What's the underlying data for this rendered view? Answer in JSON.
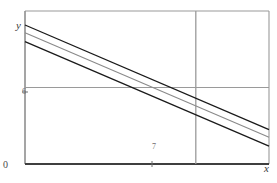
{
  "figure": {
    "axis_labels": {
      "x": "x",
      "y": "y"
    },
    "origin_label": "0",
    "tick_labels": {
      "x": "7",
      "y": "6"
    }
  },
  "chart_data": {
    "type": "line",
    "title": "",
    "xlabel": "x",
    "ylabel": "y",
    "xlim": [
      0,
      10
    ],
    "ylim": [
      0,
      12
    ],
    "grid": true,
    "gridlines": {
      "vertical": [
        7
      ],
      "horizontal": [
        6
      ]
    },
    "legend": "none",
    "annotations": [
      "Three parallel lines with equal negative slope",
      "Middle line passes through the point (7, 6)"
    ],
    "series": [
      {
        "name": "upper-line",
        "color": "#1a1a1a",
        "width": 1.3,
        "x": [
          0,
          10
        ],
        "values": [
          10.9,
          2.7
        ]
      },
      {
        "name": "middle-line",
        "color": "#8a8a8a",
        "width": 1.1,
        "x": [
          0,
          10
        ],
        "values": [
          10.3,
          2.1
        ]
      },
      {
        "name": "lower-line",
        "color": "#1a1a1a",
        "width": 1.3,
        "x": [
          0,
          10
        ],
        "values": [
          9.6,
          1.4
        ]
      }
    ]
  },
  "colors": {
    "frame": "#9a9a9a",
    "axis": "#4a4a4a",
    "gridline": "#9a9a9a",
    "line_dark": "#1a1a1a",
    "line_gray": "#8a8a8a",
    "background": "#ffffff"
  }
}
